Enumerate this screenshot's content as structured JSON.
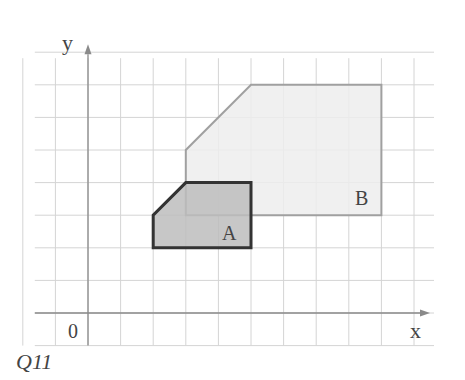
{
  "figure": {
    "axes": {
      "x_label": "x",
      "y_label": "y",
      "origin_label": "0"
    },
    "grid": {
      "origin_px": [
        88,
        313
      ],
      "unit_px": 32.6,
      "x_min": -2,
      "x_max": 10,
      "y_min": -1,
      "y_max": 8
    },
    "shapes": [
      {
        "name": "A",
        "label": "A",
        "vertices": [
          [
            2,
            2
          ],
          [
            5,
            2
          ],
          [
            5,
            4
          ],
          [
            3,
            4
          ],
          [
            2,
            3
          ]
        ],
        "fill": "#bdbdbd",
        "stroke": "#333333"
      },
      {
        "name": "B",
        "label": "B",
        "vertices": [
          [
            3,
            3
          ],
          [
            9,
            3
          ],
          [
            9,
            7
          ],
          [
            5,
            7
          ],
          [
            3,
            5
          ]
        ],
        "fill": "#ededed",
        "stroke": "#a0a0a0"
      }
    ],
    "caption": "Q11"
  }
}
